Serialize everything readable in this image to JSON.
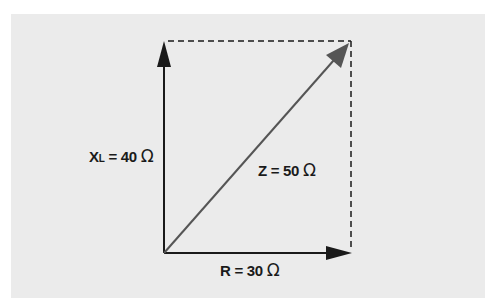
{
  "diagram": {
    "colors": {
      "background": "#ebebeb",
      "axis_vectors": "#1a1a1a",
      "resultant_vector": "#555555",
      "dashed_lines": "#1a1a1a"
    },
    "vectors": [
      {
        "id": "reactance",
        "label_main": "X",
        "label_sub": "L",
        "label_rest": " = 40 ",
        "unit": "Ω",
        "direction": "up"
      },
      {
        "id": "resistance",
        "label_main": "R",
        "label_rest": " = 30 ",
        "unit": "Ω",
        "direction": "right"
      },
      {
        "id": "impedance",
        "label_main": "Z",
        "label_rest": " = 50 ",
        "unit": "Ω",
        "direction": "diagonal"
      }
    ]
  }
}
